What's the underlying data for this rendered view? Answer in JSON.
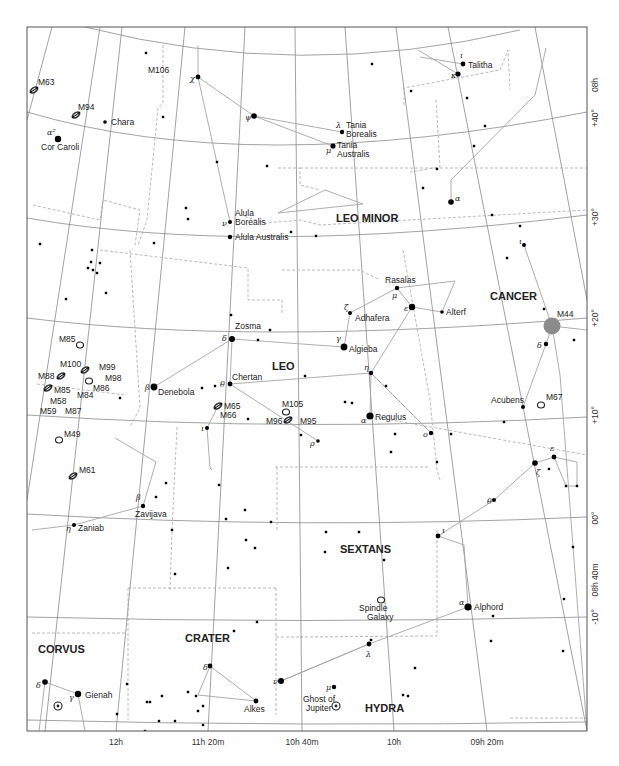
{
  "chart_data": {
    "type": "star-chart",
    "frame": {
      "x0": 27,
      "y0": 27,
      "x1": 587,
      "y1": 731
    },
    "axes": {
      "ra_labels": [
        {
          "text": "12h",
          "x": 116,
          "y": 745
        },
        {
          "text": "11h 20m",
          "x": 208,
          "y": 745
        },
        {
          "text": "10h 40m",
          "x": 302,
          "y": 745
        },
        {
          "text": "10h",
          "x": 394,
          "y": 745
        },
        {
          "text": "09h 20m",
          "x": 487,
          "y": 745
        }
      ],
      "dec_labels": [
        {
          "text": "+40°",
          "x": 598,
          "y": 118
        },
        {
          "text": "08h",
          "x": 598,
          "y": 85
        },
        {
          "text": "+30°",
          "x": 598,
          "y": 217
        },
        {
          "text": "+20°",
          "x": 598,
          "y": 318
        },
        {
          "text": "+10°",
          "x": 598,
          "y": 415
        },
        {
          "text": "00°",
          "x": 598,
          "y": 518
        },
        {
          "text": "08h 40m",
          "x": 598,
          "y": 580
        },
        {
          "text": "-10°",
          "x": 598,
          "y": 617
        }
      ]
    },
    "constellations": [
      {
        "name": "LEO MINOR",
        "x": 336,
        "y": 222
      },
      {
        "name": "LEO",
        "x": 272,
        "y": 370
      },
      {
        "name": "CANCER",
        "x": 490,
        "y": 300
      },
      {
        "name": "SEXTANS",
        "x": 340,
        "y": 553
      },
      {
        "name": "CRATER",
        "x": 185,
        "y": 642
      },
      {
        "name": "CORVUS",
        "x": 38,
        "y": 653
      },
      {
        "name": "HYDRA",
        "x": 365,
        "y": 712
      }
    ],
    "named_stars": [
      {
        "name": "Cor Caroli",
        "greek": "α²",
        "x": 58,
        "y": 139,
        "size": 3.2,
        "lx": 41,
        "ly": 150,
        "gx": 47,
        "gy": 135
      },
      {
        "name": "Chara",
        "greek": "",
        "x": 105,
        "y": 122,
        "size": 1.8,
        "lx": 111,
        "ly": 125
      },
      {
        "name": "Tania Borealis",
        "greek": "λ",
        "x": 342,
        "y": 132,
        "size": 2.2,
        "lx": 346,
        "ly": 128,
        "lx2": 346,
        "ly2": 137,
        "gx": 336,
        "gy": 128
      },
      {
        "name": "Tania Australis",
        "greek": "μ",
        "x": 333,
        "y": 146,
        "size": 2.6,
        "lx": 337,
        "ly": 148,
        "lx2": 337,
        "ly2": 157,
        "gx": 326,
        "gy": 153
      },
      {
        "name": "Talitha",
        "greek": "ι",
        "x": 463,
        "y": 64,
        "size": 2.4,
        "lx": 468,
        "ly": 68,
        "gx": 460,
        "gy": 58
      },
      {
        "name": "Alula Borealis",
        "greek": "ν",
        "x": 230,
        "y": 222,
        "size": 2,
        "lx": 235,
        "ly": 216,
        "lx2": 235,
        "ly2": 225,
        "gx": 222,
        "gy": 226
      },
      {
        "name": "Alula Australis",
        "greek": "",
        "x": 230,
        "y": 237,
        "size": 2.2,
        "lx": 235,
        "ly": 240
      },
      {
        "name": "Rasalas",
        "greek": "μ",
        "x": 397,
        "y": 288,
        "size": 2.2,
        "lx": 385,
        "ly": 283,
        "gx": 392,
        "gy": 298
      },
      {
        "name": "Adhafera",
        "greek": "ζ",
        "x": 350,
        "y": 313,
        "size": 2,
        "lx": 355,
        "ly": 321,
        "gx": 344,
        "gy": 310
      },
      {
        "name": "Alterf",
        "greek": "",
        "x": 442,
        "y": 312,
        "size": 1.8,
        "lx": 446,
        "ly": 315
      },
      {
        "name": "Algieba",
        "greek": "γ",
        "x": 344,
        "y": 347,
        "size": 3.4,
        "lx": 349,
        "ly": 352,
        "gx": 336,
        "gy": 341
      },
      {
        "name": "Zosma",
        "greek": "δ",
        "x": 232,
        "y": 339,
        "size": 3,
        "lx": 235,
        "ly": 329,
        "gx": 222,
        "gy": 341
      },
      {
        "name": "Chertan",
        "greek": "θ",
        "x": 230,
        "y": 384,
        "size": 2.4,
        "lx": 232,
        "ly": 380,
        "gx": 220,
        "gy": 387
      },
      {
        "name": "Denebola",
        "greek": "β",
        "x": 154,
        "y": 387,
        "size": 3.4,
        "lx": 158,
        "ly": 395,
        "gx": 145,
        "gy": 390
      },
      {
        "name": "Regulus",
        "greek": "α",
        "x": 370,
        "y": 416,
        "size": 3.6,
        "lx": 375,
        "ly": 420,
        "gx": 361,
        "gy": 423
      },
      {
        "name": "Acubens",
        "greek": "",
        "x": 523,
        "y": 407,
        "size": 2,
        "lx": 491,
        "ly": 403
      },
      {
        "name": "Zavijava",
        "greek": "β",
        "x": 143,
        "y": 506,
        "size": 2.2,
        "lx": 135,
        "ly": 517,
        "gx": 136,
        "gy": 500
      },
      {
        "name": "Zaniab",
        "greek": "η",
        "x": 74,
        "y": 525,
        "size": 2,
        "lx": 78,
        "ly": 531,
        "gx": 66,
        "gy": 531
      },
      {
        "name": "Alphord",
        "greek": "α",
        "x": 468,
        "y": 607,
        "size": 3.6,
        "lx": 474,
        "ly": 610,
        "gx": 459,
        "gy": 605
      },
      {
        "name": "Gienah",
        "greek": "γ",
        "x": 78,
        "y": 694,
        "size": 3.2,
        "lx": 85,
        "ly": 698,
        "gx": 69,
        "gy": 700
      },
      {
        "name": "Alkes",
        "greek": "",
        "x": 256,
        "y": 701,
        "size": 2.4,
        "lx": 244,
        "ly": 712
      }
    ],
    "greek_only_stars": [
      {
        "greek": "χ",
        "x": 198,
        "y": 77,
        "size": 2.4,
        "gx": 190,
        "gy": 81
      },
      {
        "greek": "ψ",
        "x": 254,
        "y": 116,
        "size": 2.8,
        "gx": 245,
        "gy": 120
      },
      {
        "greek": "κ",
        "x": 458,
        "y": 74,
        "size": 2.6,
        "gx": 451,
        "gy": 78
      },
      {
        "greek": "α",
        "x": 451,
        "y": 202,
        "size": 2.8,
        "gx": 455,
        "gy": 201
      },
      {
        "greek": "ε",
        "x": 412,
        "y": 307,
        "size": 3.2,
        "gx": 404,
        "gy": 311
      },
      {
        "greek": "η",
        "x": 371,
        "y": 373,
        "size": 2.2,
        "gx": 364,
        "gy": 370
      },
      {
        "greek": "ο",
        "x": 431,
        "y": 433,
        "size": 2.2,
        "gx": 423,
        "gy": 437
      },
      {
        "greek": "ρ",
        "x": 318,
        "y": 441,
        "size": 1.8,
        "gx": 310,
        "gy": 446
      },
      {
        "greek": "ι",
        "x": 207,
        "y": 428,
        "size": 2,
        "gx": 201,
        "gy": 431
      },
      {
        "greek": "ι",
        "x": 524,
        "y": 245,
        "size": 2,
        "gx": 519,
        "gy": 244
      },
      {
        "greek": "δ",
        "x": 546,
        "y": 344,
        "size": 2.2,
        "gx": 537,
        "gy": 348
      },
      {
        "greek": "ζ",
        "x": 535,
        "y": 463,
        "size": 2.8,
        "gx": 536,
        "gy": 475
      },
      {
        "greek": "ε",
        "x": 554,
        "y": 457,
        "size": 2.4,
        "gx": 550,
        "gy": 451
      },
      {
        "greek": "θ",
        "x": 494,
        "y": 500,
        "size": 2,
        "gx": 487,
        "gy": 504
      },
      {
        "greek": "ι",
        "x": 438,
        "y": 536,
        "size": 2.4,
        "gx": 442,
        "gy": 533
      },
      {
        "greek": "δ",
        "x": 210,
        "y": 666,
        "size": 2.4,
        "gx": 203,
        "gy": 670
      },
      {
        "greek": "ν",
        "x": 281,
        "y": 681,
        "size": 3,
        "gx": 273,
        "gy": 684
      },
      {
        "greek": "λ",
        "x": 369,
        "y": 644,
        "size": 2.4,
        "gx": 366,
        "gy": 657
      },
      {
        "greek": "μ",
        "x": 334,
        "y": 687,
        "size": 2.2,
        "gx": 326,
        "gy": 690
      },
      {
        "greek": "δ",
        "x": 45,
        "y": 682,
        "size": 2.8,
        "gx": 36,
        "gy": 688
      }
    ],
    "dsos": [
      {
        "name": "M63",
        "type": "galaxy",
        "x": 34,
        "y": 90,
        "lx": 38,
        "ly": 85
      },
      {
        "name": "M94",
        "type": "galaxy",
        "x": 76,
        "y": 115,
        "lx": 78,
        "ly": 110
      },
      {
        "name": "M106",
        "type": "label",
        "x": 0,
        "y": 0,
        "lx": 148,
        "ly": 73
      },
      {
        "name": "M65",
        "type": "galaxy",
        "x": 218,
        "y": 406,
        "lx": 224,
        "ly": 409
      },
      {
        "name": "M66",
        "type": "label",
        "x": 0,
        "y": 0,
        "lx": 220,
        "ly": 418
      },
      {
        "name": "M105",
        "type": "cluster-open",
        "x": 286,
        "y": 412,
        "lx": 282,
        "ly": 407
      },
      {
        "name": "M95",
        "type": "galaxy",
        "x": 288,
        "y": 420,
        "lx": 300,
        "ly": 424
      },
      {
        "name": "M96",
        "type": "label",
        "x": 0,
        "y": 0,
        "lx": 266,
        "ly": 424
      },
      {
        "name": "M85",
        "type": "cluster-open",
        "x": 80,
        "y": 345,
        "lx": 59,
        "ly": 342
      },
      {
        "name": "M100",
        "type": "galaxy",
        "x": 85,
        "y": 370,
        "lx": 60,
        "ly": 367
      },
      {
        "name": "M99",
        "type": "label",
        "x": 0,
        "y": 0,
        "lx": 99,
        "ly": 370
      },
      {
        "name": "M98",
        "type": "label",
        "x": 0,
        "y": 0,
        "lx": 105,
        "ly": 381
      },
      {
        "name": "M88",
        "type": "galaxy",
        "x": 61,
        "y": 376,
        "lx": 38,
        "ly": 379
      },
      {
        "name": "M86",
        "type": "cluster-open",
        "x": 89,
        "y": 381,
        "lx": 93,
        "ly": 391
      },
      {
        "name": "M85b",
        "display": "M85",
        "type": "galaxy",
        "x": 48,
        "y": 388,
        "lx": 54,
        "ly": 393
      },
      {
        "name": "M84",
        "type": "label",
        "x": 0,
        "y": 0,
        "lx": 77,
        "ly": 398
      },
      {
        "name": "M58",
        "type": "label",
        "x": 0,
        "y": 0,
        "lx": 50,
        "ly": 404
      },
      {
        "name": "M59",
        "type": "label",
        "x": 0,
        "y": 0,
        "lx": 40,
        "ly": 414
      },
      {
        "name": "M87",
        "type": "label",
        "x": 0,
        "y": 0,
        "lx": 65,
        "ly": 414
      },
      {
        "name": "M49",
        "type": "cluster-open",
        "x": 59,
        "y": 440,
        "lx": 64,
        "ly": 437
      },
      {
        "name": "M61",
        "type": "galaxy",
        "x": 73,
        "y": 476,
        "lx": 79,
        "ly": 473
      },
      {
        "name": "M44",
        "type": "cluster-large",
        "x": 552,
        "y": 326,
        "lx": 557,
        "ly": 317
      },
      {
        "name": "M67",
        "type": "cluster-open",
        "x": 541,
        "y": 405,
        "lx": 546,
        "ly": 400
      },
      {
        "name": "Spindle Galaxy",
        "type": "cluster-open",
        "x": 381,
        "y": 600,
        "lx": 359,
        "ly": 611,
        "lx2": 367,
        "ly2": 620
      },
      {
        "name": "Ghost of Jupiter",
        "type": "planetary",
        "x": 336,
        "y": 706,
        "lx": 303,
        "ly": 702,
        "lx2": 306,
        "ly2": 711
      },
      {
        "name": "Corvus PN",
        "display": "",
        "type": "planetary",
        "x": 58,
        "y": 706
      }
    ]
  },
  "labels": {
    "ra_12h": "12h",
    "ra_11h20": "11h 20m",
    "ra_10h40": "10h 40m",
    "ra_10h": "10h",
    "ra_09h20": "09h 20m",
    "dec_40": "+40°",
    "dec_30": "+30°",
    "dec_20": "+20°",
    "dec_10": "+10°",
    "dec_0": "00°",
    "dec_m10": "-10°",
    "ra_08h": "08h",
    "ra_08h40": "08h 40m"
  }
}
